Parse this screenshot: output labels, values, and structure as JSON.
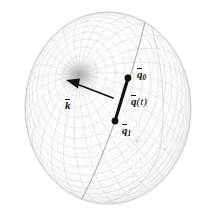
{
  "figure": {
    "background_color": "#ffffff",
    "width": 215,
    "height": 218
  },
  "sphere": {
    "name": "unit-quaternion-sphere",
    "center_x": 108,
    "center_y": 108,
    "radius_x": 83,
    "radius_y": 96,
    "outline_color": "#c9c9c9",
    "mesh_color": "#d9d9d9",
    "mesh_lines_u": 28,
    "mesh_lines_v": 28,
    "shading": "radial vortex highlight near rotation axis pole"
  },
  "vortex": {
    "name": "axis-pole-shading",
    "center_x": 79,
    "center_y": 75,
    "radius": 25,
    "core_color": "#aeaeae",
    "edge_color": "#ffffff"
  },
  "geodesic": {
    "name": "great-circle-arc",
    "color": "#9a9a9a",
    "stroke_width": 0.8,
    "description": "great circle through q1 and q0"
  },
  "axis_vector": {
    "name": "rotation-axis-vector",
    "label": "k",
    "overbar": true,
    "tail_x": 113,
    "tail_y": 98,
    "head_x": 69,
    "head_y": 81,
    "color": "#111111",
    "stroke_width": 1.6
  },
  "interpolation_segment": {
    "name": "quaternion-interpolation-chord",
    "label": "q(t)",
    "overbar": true,
    "start_x": 115,
    "start_y": 121,
    "end_x": 128,
    "end_y": 78,
    "color": "#111111",
    "stroke_width": 3.0
  },
  "points": [
    {
      "name": "point-q0",
      "label_base": "q",
      "label_sub": "0",
      "x": 128,
      "y": 78,
      "radius": 3.2,
      "color": "#111111"
    },
    {
      "name": "point-q1",
      "label_base": "q",
      "label_sub": "1",
      "x": 115,
      "y": 121,
      "radius": 3.2,
      "color": "#111111"
    }
  ],
  "labels": {
    "q0": {
      "base": "q",
      "sub": "0"
    },
    "q1": {
      "base": "q",
      "sub": "1"
    },
    "qt_base": "q",
    "qt_arg": "(t)",
    "k": "k"
  },
  "chart_data": {
    "type": "scatter",
    "xlabel": "",
    "ylabel": "",
    "annotations": [
      "q̅0",
      "q̅(t)",
      "q̅1",
      "k̅"
    ],
    "series": [
      {
        "name": "interpolation-endpoints",
        "points": [
          {
            "label": "q1",
            "x": 115,
            "y": 121
          },
          {
            "label": "q0",
            "x": 128,
            "y": 78
          }
        ]
      },
      {
        "name": "rotation-axis",
        "points": [
          {
            "label": "tail",
            "x": 113,
            "y": 98
          },
          {
            "label": "head",
            "x": 69,
            "y": 81
          }
        ]
      }
    ]
  }
}
